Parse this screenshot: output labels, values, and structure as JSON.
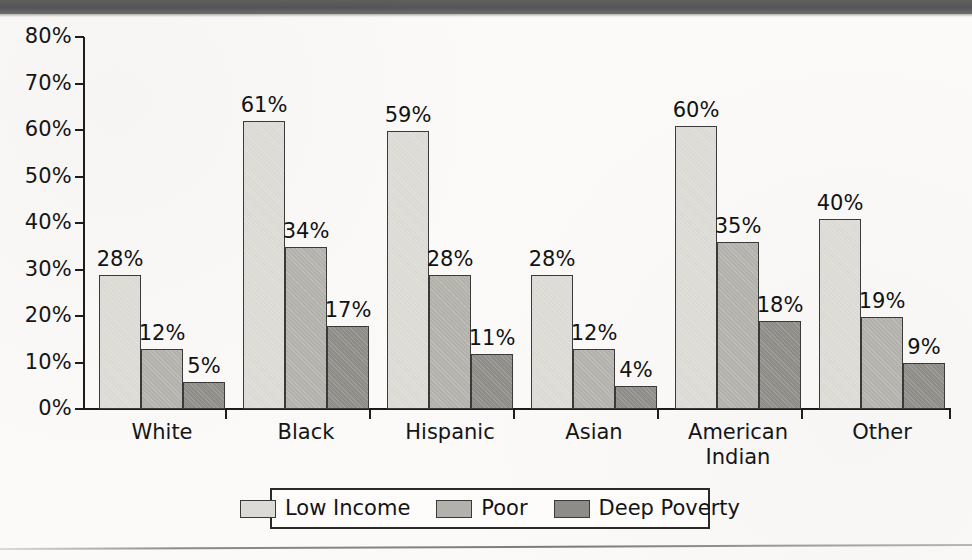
{
  "chart_data": {
    "type": "bar",
    "title": "",
    "subtitle": "",
    "xlabel": "",
    "ylabel": "",
    "ylim": [
      0,
      80
    ],
    "ytick_labels": [
      "0%",
      "10%",
      "20%",
      "30%",
      "40%",
      "50%",
      "60%",
      "70%",
      "80%"
    ],
    "ytick_values": [
      0,
      10,
      20,
      30,
      40,
      50,
      60,
      70,
      80
    ],
    "grid": false,
    "legend_position": "bottom",
    "value_label_suffix": "%",
    "categories": [
      "White",
      "Black",
      "Hispanic",
      "Asian",
      "American Indian",
      "Other"
    ],
    "category_lines": [
      [
        "White"
      ],
      [
        "Black"
      ],
      [
        "Hispanic"
      ],
      [
        "Asian"
      ],
      [
        "American",
        "Indian"
      ],
      [
        "Other"
      ]
    ],
    "series": [
      {
        "name": "Low Income",
        "color": "#dbdad5",
        "values": [
          28,
          61,
          59,
          28,
          60,
          40
        ],
        "labels": [
          "28%",
          "61%",
          "59%",
          "28%",
          "60%",
          "40%"
        ]
      },
      {
        "name": "Poor",
        "color": "#b2b1ab",
        "values": [
          12,
          34,
          28,
          12,
          35,
          19
        ],
        "labels": [
          "12%",
          "34%",
          "28%",
          "12%",
          "35%",
          "19%"
        ]
      },
      {
        "name": "Deep Poverty",
        "color": "#8d8c87",
        "values": [
          5,
          17,
          11,
          4,
          18,
          9
        ],
        "labels": [
          "5%",
          "17%",
          "11%",
          "4%",
          "18%",
          "9%"
        ]
      }
    ]
  },
  "legend": {
    "entries": [
      {
        "label": "Low Income"
      },
      {
        "label": "Poor"
      },
      {
        "label": "Deep Poverty"
      }
    ]
  },
  "colors": {
    "low_income": "#dbdad5",
    "poor": "#b2b1ab",
    "deep_poverty": "#8d8c87",
    "axis": "#1d1d1d",
    "text": "#151515",
    "page_background": "#fbfaf8",
    "scan_band": "#5f5f5d"
  }
}
